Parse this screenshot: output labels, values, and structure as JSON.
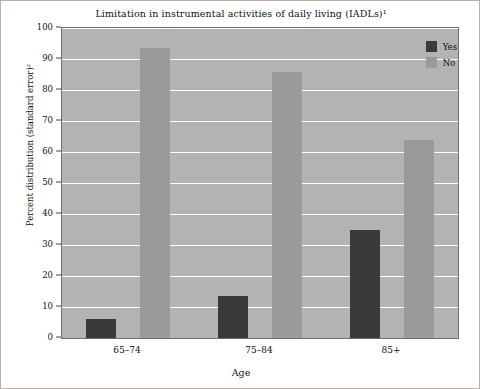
{
  "chart_data": {
    "type": "bar",
    "title": "Limitation in instrumental activities of daily living (IADLs)¹",
    "xlabel": "Age",
    "ylabel": "Percent distribution (standard error)²",
    "categories": [
      "65–74",
      "75–84",
      "85+"
    ],
    "series": [
      {
        "name": "Yes",
        "values": [
          6.0,
          13.4,
          34.8
        ],
        "color": "#3a3a3a"
      },
      {
        "name": "No",
        "values": [
          93.4,
          85.8,
          64.0
        ],
        "color": "#9a9a9a"
      }
    ],
    "ylim": [
      0,
      100
    ],
    "yticks": [
      0,
      10,
      20,
      30,
      40,
      50,
      60,
      70,
      80,
      90,
      100
    ],
    "ytick_labels": [
      "0",
      "10",
      "20",
      "30",
      "40",
      "50",
      "60",
      "70",
      "80",
      "90",
      "100"
    ],
    "grid": true,
    "legend_position": "top-right",
    "plot_background": "#b3b3b3",
    "gridline_color": "#ffffff",
    "figure_border": "#b9b0a6"
  }
}
